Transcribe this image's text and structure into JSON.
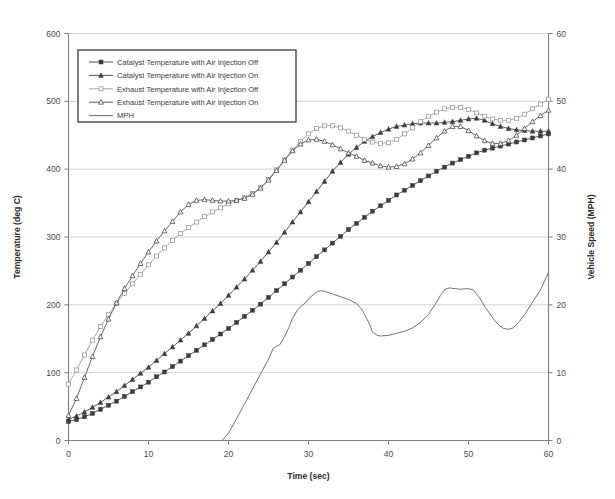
{
  "chart_data": {
    "type": "line",
    "title": "",
    "xlabel": "Time (sec)",
    "ylabel": "Temperature (deg C)",
    "y2label": "Vehicle Speed (MPH)",
    "xlim": [
      0,
      60
    ],
    "ylim": [
      0,
      600
    ],
    "y2lim": [
      0,
      60
    ],
    "xticks": [
      0,
      10,
      20,
      30,
      40,
      50,
      60
    ],
    "yticks": [
      0,
      100,
      200,
      300,
      400,
      500,
      600
    ],
    "y2ticks": [
      0,
      10,
      20,
      30,
      40,
      50,
      60
    ],
    "grid": true,
    "legend_position": "upper-left",
    "x": [
      0,
      1,
      2,
      3,
      4,
      5,
      6,
      7,
      8,
      9,
      10,
      11,
      12,
      13,
      14,
      15,
      16,
      17,
      18,
      19,
      20,
      21,
      22,
      23,
      24,
      25,
      26,
      27,
      28,
      29,
      30,
      31,
      32,
      33,
      34,
      35,
      36,
      37,
      38,
      39,
      40,
      41,
      42,
      43,
      44,
      45,
      46,
      47,
      48,
      49,
      50,
      51,
      52,
      53,
      54,
      55,
      56,
      57,
      58,
      59,
      60
    ],
    "series": [
      {
        "name": "Catalyst Temperature with Air Injection Off",
        "marker": "filled-square",
        "color": "#3d3d3d",
        "axis": "left",
        "values": [
          28,
          31,
          35,
          40,
          46,
          52,
          58,
          65,
          72,
          79,
          86,
          94,
          101,
          109,
          117,
          125,
          133,
          141,
          149,
          157,
          165,
          174,
          183,
          192,
          201,
          211,
          221,
          231,
          241,
          251,
          261,
          271,
          281,
          291,
          301,
          311,
          320,
          329,
          338,
          346,
          354,
          362,
          369,
          376,
          383,
          390,
          397,
          403,
          409,
          414,
          419,
          424,
          428,
          431,
          434,
          437,
          440,
          443,
          446,
          449,
          452
        ]
      },
      {
        "name": "Catalyst Temperature with Air Injection On",
        "marker": "filled-triangle",
        "color": "#3d3d3d",
        "axis": "left",
        "values": [
          31,
          36,
          42,
          49,
          56,
          64,
          72,
          81,
          90,
          99,
          108,
          118,
          128,
          138,
          148,
          158,
          169,
          180,
          191,
          202,
          214,
          226,
          238,
          251,
          264,
          278,
          292,
          307,
          322,
          337,
          352,
          367,
          382,
          397,
          410,
          422,
          432,
          441,
          448,
          454,
          459,
          463,
          465,
          467,
          468,
          468,
          468,
          469,
          470,
          472,
          474,
          475,
          472,
          467,
          463,
          460,
          458,
          457,
          456,
          456,
          456
        ]
      },
      {
        "name": "Exhaust Temperature with Air Injection Off",
        "marker": "open-square",
        "color": "#9a9a9a",
        "axis": "left",
        "values": [
          83,
          104,
          126,
          148,
          168,
          186,
          202,
          217,
          231,
          245,
          259,
          272,
          284,
          295,
          305,
          314,
          322,
          330,
          337,
          343,
          349,
          354,
          358,
          364,
          373,
          385,
          399,
          414,
          428,
          441,
          452,
          460,
          464,
          464,
          461,
          456,
          450,
          444,
          440,
          438,
          439,
          444,
          452,
          461,
          470,
          478,
          484,
          489,
          491,
          491,
          488,
          483,
          478,
          474,
          472,
          472,
          475,
          481,
          489,
          496,
          503
        ]
      },
      {
        "name": "Exhaust Temperature with Air Injection On",
        "marker": "open-triangle",
        "color": "#4a4a4a",
        "axis": "left",
        "values": [
          37,
          62,
          93,
          124,
          153,
          179,
          203,
          224,
          243,
          261,
          278,
          294,
          309,
          323,
          337,
          348,
          354,
          355,
          354,
          353,
          353,
          354,
          357,
          363,
          372,
          384,
          398,
          413,
          427,
          437,
          443,
          444,
          441,
          436,
          430,
          424,
          419,
          413,
          409,
          405,
          403,
          404,
          408,
          415,
          424,
          435,
          446,
          456,
          463,
          463,
          457,
          449,
          442,
          438,
          438,
          442,
          450,
          460,
          470,
          479,
          487
        ]
      },
      {
        "name": "MPH",
        "marker": "none",
        "color": "#5a5a5a",
        "axis": "right",
        "x": [
          19.2,
          20,
          21,
          22,
          23,
          24,
          25,
          25.6,
          26,
          26.4,
          27,
          27.6,
          28,
          28.6,
          29,
          29.6,
          30,
          30.6,
          31,
          31.6,
          32,
          33,
          34,
          35,
          36,
          36.6,
          37,
          37.6,
          38,
          38.6,
          39,
          40,
          41,
          42,
          43,
          44,
          45,
          45.8,
          46.5,
          47,
          47.6,
          48.2,
          49,
          49.8,
          50.6,
          51.4,
          52,
          52.6,
          53.2,
          53.8,
          54.4,
          55,
          55.6,
          56.4,
          57.2,
          58,
          59,
          60
        ],
        "values": [
          0,
          1.1,
          3.2,
          5.4,
          7.6,
          9.8,
          12.0,
          13.6,
          13.9,
          14.1,
          15.3,
          16.8,
          18.0,
          19.2,
          19.7,
          20.3,
          20.9,
          21.5,
          21.9,
          22.1,
          22.0,
          21.6,
          21.2,
          20.8,
          20.2,
          19.4,
          18.6,
          17.2,
          16.0,
          15.5,
          15.4,
          15.5,
          15.8,
          16.1,
          16.6,
          17.4,
          18.6,
          20.0,
          21.4,
          22.2,
          22.5,
          22.4,
          22.3,
          22.4,
          22.2,
          21.0,
          19.8,
          18.8,
          17.8,
          17.0,
          16.5,
          16.4,
          16.6,
          17.6,
          18.9,
          20.4,
          22.2,
          24.8
        ]
      }
    ]
  },
  "legend": {
    "items": [
      {
        "label": "Catalyst Temperature with Air Injection Off"
      },
      {
        "label": "Catalyst Temperature with Air Injection On"
      },
      {
        "label": "Exhaust Temperature with Air Injection Off"
      },
      {
        "label": "Exhaust Temperature with Air Injection On"
      },
      {
        "label": "MPH"
      }
    ]
  },
  "axes": {
    "x_title": "Time (sec)",
    "y_left_title": "Temperature (deg C)",
    "y_right_title": "Vehicle Speed (MPH)"
  }
}
